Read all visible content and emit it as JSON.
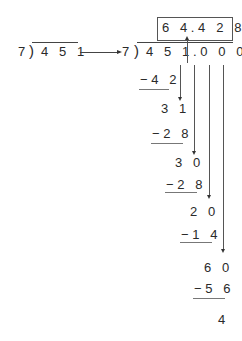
{
  "left_division": {
    "divisor": "7",
    "dividend": "4 5 1"
  },
  "right_division": {
    "divisor": "7",
    "dividend": "4 5 1.0 0 0",
    "quotient": "6 4.4 2 8"
  },
  "steps": [
    {
      "subtract": "−4 2",
      "remainder": "3 1"
    },
    {
      "subtract": "−2 8",
      "remainder": "3 0"
    },
    {
      "subtract": "−2 8",
      "remainder": "2 0"
    },
    {
      "subtract": "−1 4",
      "remainder": "6 0"
    },
    {
      "subtract": "−5 6",
      "remainder": "4"
    }
  ],
  "colors": {
    "text": "#2a2a2a",
    "lines": "#555555"
  }
}
